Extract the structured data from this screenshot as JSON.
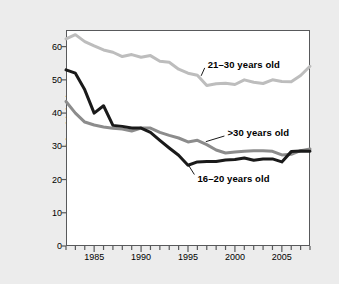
{
  "chart_data": {
    "type": "line",
    "title": "",
    "subtitle": "",
    "xlabel": "",
    "ylabel": "Percent of fatal injuries",
    "xlim": [
      1982,
      2008
    ],
    "ylim": [
      0,
      65
    ],
    "grid": false,
    "legend_position": "inline-annotations",
    "y_ticks": [
      0,
      10,
      20,
      30,
      40,
      50,
      60
    ],
    "y_tick_labels": [
      "0",
      "10",
      "20",
      "30",
      "40",
      "50",
      "60"
    ],
    "x_ticks": [
      1985,
      1990,
      1995,
      2000,
      2005
    ],
    "x_tick_labels": [
      "1985",
      "1990",
      "1995",
      "2000",
      "2005"
    ],
    "x_minor_ticks": [
      1982,
      1983,
      1984,
      1985,
      1986,
      1987,
      1988,
      1989,
      1990,
      1991,
      1992,
      1993,
      1994,
      1995,
      1996,
      1997,
      1998,
      1999,
      2000,
      2001,
      2002,
      2003,
      2004,
      2005,
      2006,
      2007,
      2008
    ],
    "x": [
      1982,
      1983,
      1984,
      1985,
      1986,
      1987,
      1988,
      1989,
      1990,
      1991,
      1992,
      1993,
      1994,
      1995,
      1996,
      1997,
      1998,
      1999,
      2000,
      2001,
      2002,
      2003,
      2004,
      2005,
      2006,
      2007,
      2008
    ],
    "series": [
      {
        "name": "21–30 years old",
        "color": "#bdbdbd",
        "width": 3.0,
        "values": [
          62.3,
          63.6,
          61.5,
          60.2,
          59.0,
          58.3,
          57.0,
          57.6,
          56.8,
          57.3,
          55.6,
          55.3,
          53.2,
          52.0,
          51.4,
          48.3,
          48.8,
          49.0,
          48.6,
          50.0,
          49.3,
          48.9,
          50.0,
          49.5,
          49.4,
          51.3,
          54.1
        ]
      },
      {
        "name": ">30 years old",
        "color": "#8c8c8c",
        "width": 3.0,
        "values": [
          43.5,
          40.0,
          37.3,
          36.4,
          35.8,
          35.4,
          35.2,
          34.6,
          35.5,
          35.5,
          34.2,
          33.3,
          32.5,
          31.3,
          31.8,
          30.5,
          28.9,
          28.0,
          28.3,
          28.5,
          28.7,
          28.7,
          28.5,
          27.4,
          27.6,
          28.7,
          29.2
        ]
      },
      {
        "name": "16–20 years old",
        "color": "#1a1a1a",
        "width": 3.0,
        "values": [
          53.0,
          52.0,
          47.0,
          40.0,
          42.2,
          36.3,
          36.0,
          35.5,
          35.5,
          34.2,
          31.8,
          29.5,
          27.3,
          24.3,
          25.3,
          25.4,
          25.4,
          25.9,
          26.0,
          26.5,
          25.8,
          26.2,
          26.2,
          25.3,
          28.4,
          28.6,
          28.5
        ]
      }
    ],
    "annotations": [
      {
        "label": "21–30 years old",
        "x": 1997.1,
        "y": 54.5,
        "leader_from_x": 1996.4,
        "leader_from_y": 51.2
      },
      {
        "label": ">30 years old",
        "x": 1999.2,
        "y": 34.0,
        "leader_from_x": 1996.9,
        "leader_from_y": 31.4
      },
      {
        "label": "16–20 years old",
        "x": 1996.0,
        "y": 20.3,
        "leader_from_x": 1995.1,
        "leader_from_y": 24.1
      }
    ]
  },
  "colors": {
    "background": "#ececec",
    "plot_background": "#ffffff",
    "axis": "#58595b",
    "text": "#000000",
    "series_21_30": "#bdbdbd",
    "series_over_30": "#8c8c8c",
    "series_16_20": "#1a1a1a"
  }
}
